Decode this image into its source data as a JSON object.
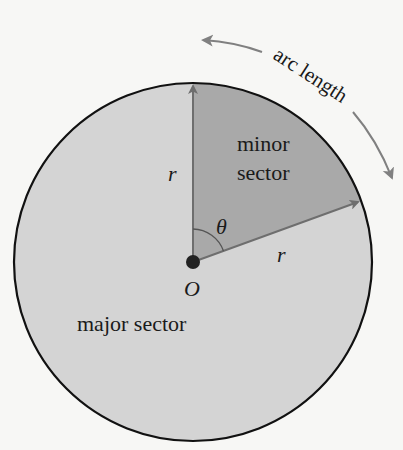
{
  "diagram": {
    "labels": {
      "arc_length": "arc length",
      "minor_sector_line1": "minor",
      "minor_sector_line2": "sector",
      "major_sector": "major sector",
      "radius_vertical": "r",
      "radius_slanted": "r",
      "angle": "θ",
      "center": "O"
    },
    "geometry": {
      "center": [
        193,
        262
      ],
      "radius": 179,
      "radius1_angle_deg": 90,
      "radius2_angle_deg": 20
    },
    "colors": {
      "background": "#f7f7f5",
      "major_sector_fill": "#d4d4d4",
      "minor_sector_fill": "#a9a9a9",
      "circle_outline": "#111111",
      "radius_arrow": "#6e6e6e",
      "arc_arrow": "#808080",
      "center_dot": "#222222"
    }
  }
}
